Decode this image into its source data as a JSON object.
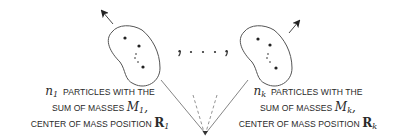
{
  "diagram": {
    "type": "particle-groups",
    "separator": ", · · · ,",
    "groups": [
      {
        "id": "group-1",
        "count_symbol": "n",
        "count_subscript": "1",
        "line1_text": "PARTICLES WITH THE",
        "line2_text": "SUM OF MASSES",
        "mass_symbol": "M",
        "mass_subscript": "1",
        "mass_suffix": ",",
        "line3_text": "CENTER OF MASS POSITION",
        "position_symbol": "R",
        "position_subscript": "1",
        "arrow_direction": "up-left",
        "particle_dots": 4
      },
      {
        "id": "group-k",
        "count_symbol": "n",
        "count_subscript": "k",
        "line1_text": "PARTICLES WITH THE",
        "line2_text": "SUM OF MASSES",
        "mass_symbol": "M",
        "mass_subscript": "k",
        "mass_suffix": ",",
        "line3_text": "CENTER OF MASS POSITION",
        "position_symbol": "R",
        "position_subscript": "k",
        "arrow_direction": "up-right",
        "particle_dots": 4
      }
    ],
    "origin": {
      "description": "common origin point with solid lines to groups 1 and k, dashed lines to intermediate groups"
    },
    "colors": {
      "stroke": "#555555",
      "text": "#2a2a2a",
      "background": "#ffffff"
    }
  }
}
